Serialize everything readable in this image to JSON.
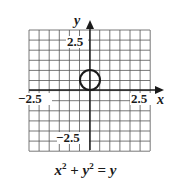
{
  "chart_data": {
    "type": "line",
    "title": "",
    "equation": "x^2 + y^2 = y",
    "xlabel": "x",
    "ylabel": "y",
    "xlim": [
      -3,
      3
    ],
    "ylim": [
      -3,
      3
    ],
    "grid": true,
    "grid_step": 0.5,
    "tick_labels": {
      "x": [
        "-2.5",
        "2.5"
      ],
      "y": [
        "2.5",
        "-2.5"
      ]
    },
    "series": [
      {
        "name": "x^2 + y^2 = y",
        "shape": "circle",
        "center": [
          0,
          0.5
        ],
        "radius": 0.5
      }
    ],
    "colors": {
      "grid": "#555555",
      "axis": "#1a1a1a",
      "curve": "#1a1a1a"
    }
  },
  "labels": {
    "x_axis": "x",
    "y_axis": "y",
    "x_neg": "−2.5",
    "x_pos": "2.5",
    "y_pos": "2.5",
    "y_neg": "−2.5"
  },
  "caption": {
    "x": "x",
    "xexp": "2",
    "plus": " + ",
    "y": "y",
    "yexp": "2",
    "eq": " = ",
    "rhs": "y"
  }
}
